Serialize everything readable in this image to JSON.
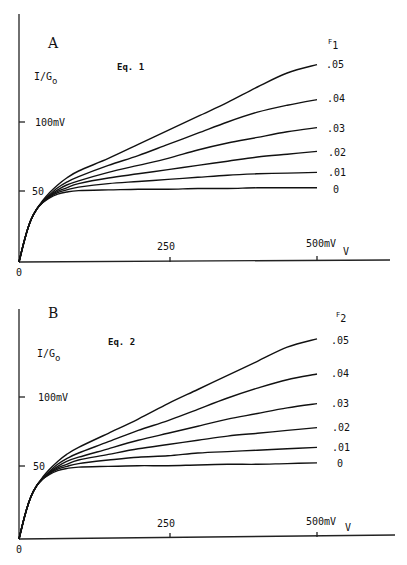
{
  "chart_data": [
    {
      "type": "line",
      "panel": "A",
      "title": "Eq. 1",
      "ylabel": "I/G",
      "ylabel_sub": "o",
      "xlabel": "V",
      "legend_title": "F",
      "legend_title_sub": "1",
      "x_ticks": [
        {
          "value": 0,
          "label": "0"
        },
        {
          "value": 250,
          "label": "250"
        },
        {
          "value": 500,
          "label": "500mV"
        }
      ],
      "y_ticks": [
        {
          "value": 50,
          "label": "50"
        },
        {
          "value": 100,
          "label": "100mV"
        }
      ],
      "xlim": [
        0,
        620
      ],
      "ylim": [
        0,
        178
      ],
      "grid": false,
      "x": [
        0,
        10,
        20,
        30,
        40,
        50,
        65,
        80,
        100,
        150,
        200,
        250,
        300,
        350,
        400,
        450,
        500
      ],
      "series": [
        {
          "name": ".05",
          "values": [
            0,
            17,
            30,
            38,
            44,
            49,
            55,
            60,
            65,
            74,
            84,
            94,
            104,
            114,
            125,
            135,
            141
          ]
        },
        {
          "name": ".04",
          "values": [
            0,
            17,
            30,
            38,
            43,
            47.5,
            53,
            57,
            61,
            69,
            76,
            84,
            92,
            100,
            107,
            112,
            116
          ]
        },
        {
          "name": ".03",
          "values": [
            0,
            17,
            30,
            38,
            43,
            47,
            51.5,
            55,
            58,
            64,
            69,
            74,
            80,
            85,
            89,
            93,
            96
          ]
        },
        {
          "name": ".02",
          "values": [
            0,
            17,
            30,
            38,
            43,
            46.5,
            50.5,
            53,
            56,
            60,
            63,
            66,
            69,
            72,
            75,
            77,
            79
          ]
        },
        {
          "name": ".01",
          "values": [
            0,
            17,
            30,
            38,
            42.5,
            46,
            49.5,
            51.5,
            53.5,
            56,
            57.5,
            59,
            60.5,
            62,
            63,
            63.5,
            64
          ]
        },
        {
          "name": "0",
          "values": [
            0,
            17,
            30,
            38,
            42.5,
            45.5,
            48.5,
            50,
            51,
            51.5,
            52,
            52,
            52.5,
            52.5,
            53,
            53,
            53
          ]
        }
      ]
    },
    {
      "type": "line",
      "panel": "B",
      "title": "Eq. 2",
      "ylabel": "I/G",
      "ylabel_sub": "o",
      "xlabel": "V",
      "legend_title": "F",
      "legend_title_sub": "2",
      "x_ticks": [
        {
          "value": 0,
          "label": "0"
        },
        {
          "value": 250,
          "label": "250"
        },
        {
          "value": 500,
          "label": "500mV"
        }
      ],
      "y_ticks": [
        {
          "value": 50,
          "label": "50"
        },
        {
          "value": 100,
          "label": "100mV"
        }
      ],
      "xlim": [
        0,
        620
      ],
      "ylim": [
        0,
        163
      ],
      "grid": false,
      "x": [
        0,
        10,
        20,
        30,
        40,
        50,
        65,
        80,
        100,
        150,
        200,
        250,
        300,
        350,
        400,
        450,
        500
      ],
      "series": [
        {
          "name": ".05",
          "values": [
            0,
            17,
            30,
            38,
            44,
            49,
            55,
            60,
            65,
            75,
            85,
            96,
            106,
            116,
            126,
            136,
            142
          ]
        },
        {
          "name": ".04",
          "values": [
            0,
            17,
            30,
            38,
            43,
            47.5,
            53,
            57,
            61,
            69,
            77,
            84,
            92,
            100,
            107,
            113,
            117
          ]
        },
        {
          "name": ".03",
          "values": [
            0,
            17,
            30,
            38,
            43,
            47,
            51.5,
            55,
            58,
            64,
            70,
            75,
            80,
            85,
            89,
            93,
            96
          ]
        },
        {
          "name": ".02",
          "values": [
            0,
            17,
            30,
            38,
            43,
            46.5,
            50.5,
            53,
            56,
            60,
            64,
            67,
            70,
            73,
            75,
            77,
            79
          ]
        },
        {
          "name": ".01",
          "values": [
            0,
            17,
            30,
            38,
            42.5,
            46,
            49.5,
            51.5,
            53.5,
            56,
            58,
            59,
            61,
            62,
            63,
            64,
            65
          ]
        },
        {
          "name": "0",
          "values": [
            0,
            17,
            30,
            38,
            42.5,
            45.5,
            48.5,
            50,
            51,
            51.5,
            52,
            52,
            52.5,
            53,
            53,
            53.5,
            54
          ]
        }
      ]
    }
  ],
  "panels": {
    "a": {
      "letter": "A",
      "eq": "Eq. 1",
      "ylabel": "I/G",
      "ylabel_sub": "o",
      "xlabel": "V",
      "legend_title": "F",
      "legend_sub": "1",
      "tick_0": "0",
      "tick_250": "250",
      "tick_500": "500mV",
      "tick_50": "50",
      "tick_100": "100mV",
      "legend": [
        ".05",
        ".04",
        ".03",
        ".02",
        ".01",
        "0"
      ]
    },
    "b": {
      "letter": "B",
      "eq": "Eq. 2",
      "ylabel": "I/G",
      "ylabel_sub": "o",
      "xlabel": "V",
      "legend_title": "F",
      "legend_sub": "2",
      "tick_0": "0",
      "tick_250": "250",
      "tick_500": "500mV",
      "tick_50": "50",
      "tick_100": "100mV",
      "legend": [
        ".05",
        ".04",
        ".03",
        ".02",
        ".01",
        "0"
      ]
    }
  }
}
